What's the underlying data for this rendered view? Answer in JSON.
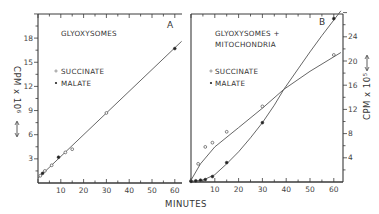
{
  "chart_data": [
    {
      "panel": "A",
      "type": "scatter",
      "title": "GLYOXYSOMES",
      "xlabel": "MINUTES",
      "ylabel": "CPM x 10^6",
      "ylabel_display": "CPM x 10⁶",
      "xlim": [
        0,
        63
      ],
      "ylim": [
        0,
        21
      ],
      "x_ticks": [
        10,
        20,
        30,
        40,
        50,
        60
      ],
      "y_ticks": [
        3,
        6,
        9,
        12,
        15,
        18
      ],
      "y_axis_side": "left",
      "legend": [
        {
          "name": "SUCCINATE",
          "marker": "open-circle"
        },
        {
          "name": "MALATE",
          "marker": "filled-circle"
        }
      ],
      "series": [
        {
          "name": "SUCCINATE",
          "marker": "open",
          "x": [
            1,
            3,
            6,
            12,
            15,
            30
          ],
          "y": [
            0.9,
            1.5,
            2.2,
            3.8,
            4.2,
            8.7
          ]
        },
        {
          "name": "MALATE",
          "marker": "filled",
          "x": [
            2,
            9,
            60
          ],
          "y": [
            1.2,
            3.2,
            16.7
          ]
        }
      ],
      "fit_line": {
        "type": "linear",
        "x": [
          0,
          63
        ],
        "y": [
          0.6,
          17.6
        ]
      },
      "grid": false
    },
    {
      "panel": "B",
      "type": "scatter",
      "title": "GLYOXYSOMES + MITOCHONDRIA",
      "title_lines": [
        "GLYOXYSOMES +",
        "MITOCHONDRIA"
      ],
      "xlabel": "MINUTES",
      "ylabel": "CPM x 10^5",
      "ylabel_display": "CPM x 10⁵",
      "xlim": [
        0,
        64
      ],
      "ylim": [
        0,
        28
      ],
      "x_ticks": [
        10,
        20,
        30,
        40,
        50,
        60
      ],
      "y_ticks": [
        4,
        8,
        12,
        16,
        20,
        24
      ],
      "y_axis_side": "right",
      "legend": [
        {
          "name": "SUCCINATE",
          "marker": "open-circle"
        },
        {
          "name": "MALATE",
          "marker": "filled-circle"
        }
      ],
      "series": [
        {
          "name": "SUCCINATE",
          "marker": "open",
          "x": [
            0,
            3,
            6,
            9,
            15,
            30,
            60
          ],
          "y": [
            0.2,
            3.0,
            5.8,
            6.5,
            8.3,
            12.5,
            21.0
          ],
          "curve": {
            "x": [
              0,
              4,
              10,
              20,
              30,
              39,
              50,
              63
            ],
            "y": [
              0.3,
              3.0,
              5.8,
              9.0,
              12.2,
              15.3,
              18.3,
              21.4
            ]
          }
        },
        {
          "name": "MALATE",
          "marker": "filled",
          "x": [
            0,
            2,
            4,
            6,
            9,
            15,
            30,
            60
          ],
          "y": [
            0.1,
            0.2,
            0.3,
            0.4,
            0.9,
            3.2,
            9.8,
            27.0
          ],
          "curve": {
            "x": [
              0,
              5,
              10,
              15,
              20,
              25,
              30,
              35,
              39,
              45,
              50,
              55,
              63
            ],
            "y": [
              0.1,
              0.3,
              1.2,
              3.0,
              5.0,
              7.3,
              9.8,
              12.7,
              15.3,
              18.7,
              21.5,
              24.2,
              28.5
            ]
          }
        }
      ],
      "annotations": [
        "B"
      ],
      "grid": false
    }
  ],
  "figure": {
    "panel_labels": [
      "A",
      "B"
    ],
    "shared_xlabel": "MINUTES",
    "left_axis_title": "CPM x 10⁶",
    "right_axis_title": "CPM x 10⁵"
  }
}
